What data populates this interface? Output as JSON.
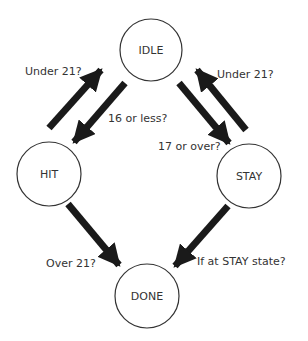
{
  "diagram": {
    "type": "state-machine",
    "colors": {
      "stroke": "#333333",
      "arrow": "#1a1a1a",
      "text": "#333333",
      "background": "#ffffff"
    },
    "nodes": [
      {
        "id": "idle",
        "label": "IDLE"
      },
      {
        "id": "hit",
        "label": "HIT"
      },
      {
        "id": "stay",
        "label": "STAY"
      },
      {
        "id": "done",
        "label": "DONE"
      }
    ],
    "edges": [
      {
        "from": "hit",
        "to": "idle",
        "label": "Under 21?"
      },
      {
        "from": "idle",
        "to": "hit",
        "label": "16 or less?"
      },
      {
        "from": "idle",
        "to": "stay",
        "label": "17 or over?"
      },
      {
        "from": "stay",
        "to": "idle",
        "label": "Under 21?"
      },
      {
        "from": "hit",
        "to": "done",
        "label": "Over 21?"
      },
      {
        "from": "stay",
        "to": "done",
        "label": "If at STAY state?"
      }
    ]
  }
}
